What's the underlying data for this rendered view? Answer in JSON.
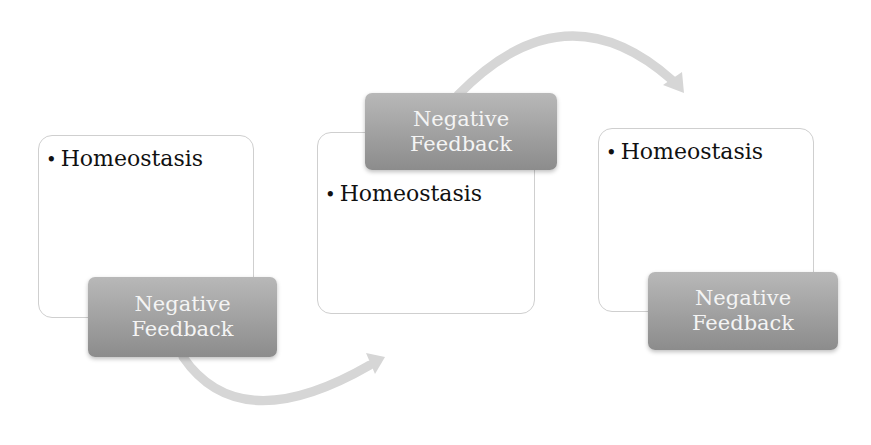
{
  "diagram": {
    "type": "process-flow",
    "steps": [
      {
        "bullet": "Homeostasis",
        "label_line1": "Negative",
        "label_line2": "Feedback"
      },
      {
        "bullet": "Homeostasis",
        "label_line1": "Negative",
        "label_line2": "Feedback"
      },
      {
        "bullet": "Homeostasis",
        "label_line1": "Negative",
        "label_line2": "Feedback"
      }
    ],
    "colors": {
      "label_top": "#b8b8b8",
      "label_bottom": "#8c8c8c",
      "arrow": "#d6d6d6",
      "box_border": "#cfcfcf"
    }
  }
}
